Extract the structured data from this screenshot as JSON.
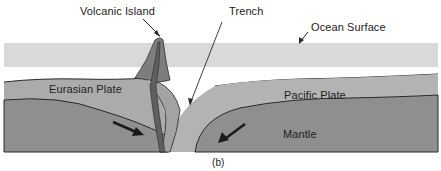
{
  "diagram": {
    "caption": "(b)",
    "labels": {
      "volcanic_island": "Volcanic Island",
      "trench": "Trench",
      "ocean_surface": "Ocean Surface",
      "eurasian_plate": "Eurasian Plate",
      "pacific_plate": "Pacific Plate",
      "mantle": "Mantle"
    },
    "colors": {
      "ocean": "#d9d9d9",
      "plate": "#a8a8a8",
      "mantle": "#8c8c8c",
      "volcano": "#7a7a7a",
      "subducting_plate": "#b8b8b8",
      "outline": "#2a2a2a"
    }
  }
}
